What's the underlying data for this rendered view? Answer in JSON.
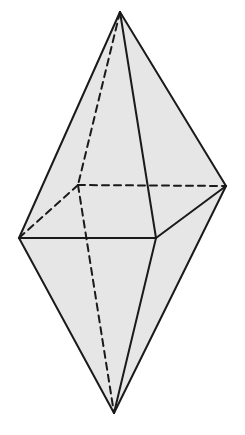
{
  "diagram": {
    "title": "",
    "type": "square bipyramid (octahedron) with hidden edges dashed",
    "fill_color": "#e6e6e6",
    "stroke_color": "#1a1a1a",
    "background": "#ffffff",
    "vertices": {
      "top_apex": [
        120,
        12
      ],
      "bottom_apex": [
        114,
        413
      ],
      "left": [
        19,
        238
      ],
      "front": [
        156,
        238
      ],
      "right": [
        226,
        186
      ],
      "back": [
        78,
        185
      ]
    },
    "visible_edges": [
      [
        "top_apex",
        "left"
      ],
      [
        "top_apex",
        "front"
      ],
      [
        "top_apex",
        "right"
      ],
      [
        "left",
        "front"
      ],
      [
        "front",
        "right"
      ],
      [
        "left",
        "bottom_apex"
      ],
      [
        "front",
        "bottom_apex"
      ],
      [
        "right",
        "bottom_apex"
      ]
    ],
    "hidden_edges": [
      [
        "top_apex",
        "back"
      ],
      [
        "back",
        "left"
      ],
      [
        "back",
        "right"
      ],
      [
        "back",
        "bottom_apex"
      ]
    ],
    "labels": []
  }
}
